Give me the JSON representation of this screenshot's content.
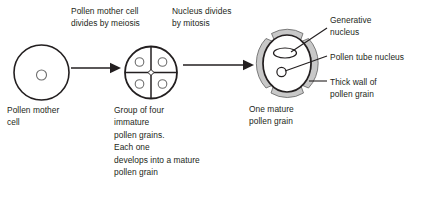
{
  "diagram": {
    "background_color": "#ffffff",
    "ink_color": "#231f20",
    "wall_fill_color": "#c8c8c8",
    "wall_stroke_color": "#6e6e6e",
    "process_steps": [
      {
        "id": "step1",
        "label": "Pollen mother cell\ndivides by meiosis"
      },
      {
        "id": "step2",
        "label": "Nucleus divides\nby mitosis"
      }
    ],
    "stages": [
      {
        "id": "stage1",
        "caption": "Pollen mother\ncell",
        "shape": "circle-with-single-nucleus"
      },
      {
        "id": "stage2",
        "caption": "Group of four\nimmature\npollen grains.\nEach one\ndevelops into a mature\npollen grain",
        "shape": "circle-divided-into-four-with-nuclei"
      },
      {
        "id": "stage3",
        "caption": "One mature\npollen grain",
        "shape": "oval-with-thick-segmented-wall"
      }
    ],
    "callouts": [
      {
        "id": "generative-nucleus",
        "label": "Generative\nnucleus"
      },
      {
        "id": "pollen-tube-nucleus",
        "label": "Pollen tube nucleus"
      },
      {
        "id": "thick-wall",
        "label": "Thick wall of\npollen grain"
      }
    ],
    "arrows": [
      {
        "id": "arrow-meiosis",
        "from": "stage1",
        "to": "stage2",
        "direction": "right"
      },
      {
        "id": "arrow-mitosis",
        "from": "stage2",
        "to": "stage3",
        "direction": "right"
      }
    ]
  }
}
